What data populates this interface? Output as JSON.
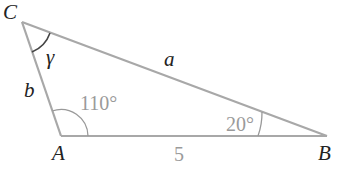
{
  "diagram": {
    "type": "triangle",
    "colors": {
      "edge": "#a8a8a8",
      "label": "#222222",
      "measure": "#9a9a9a"
    },
    "vertices": {
      "C": {
        "label": "C",
        "x": 22,
        "y": 22
      },
      "A": {
        "label": "A",
        "x": 61,
        "y": 136
      },
      "B": {
        "label": "B",
        "x": 327,
        "y": 136
      }
    },
    "sides": {
      "a": {
        "label": "a",
        "between": "C-B"
      },
      "b": {
        "label": "b",
        "between": "C-A"
      },
      "c": {
        "label": "5",
        "between": "A-B"
      }
    },
    "angles": {
      "C": {
        "label": "γ"
      },
      "A": {
        "label": "110°"
      },
      "B": {
        "label": "20°"
      }
    }
  }
}
